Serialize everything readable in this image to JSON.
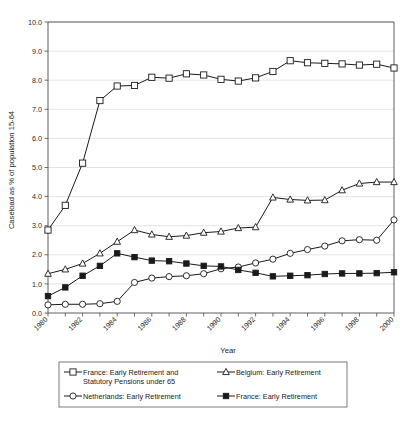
{
  "chart_data": {
    "type": "line",
    "title": "",
    "xlabel": "Year",
    "ylabel": "Caseload as % of population 15-64",
    "xlim": [
      1980,
      2000
    ],
    "ylim": [
      0.0,
      10.0
    ],
    "grid": true,
    "legend_position": "bottom",
    "x": [
      1980,
      1981,
      1982,
      1983,
      1984,
      1985,
      1986,
      1987,
      1988,
      1989,
      1990,
      1991,
      1992,
      1993,
      1994,
      1995,
      1996,
      1997,
      1998,
      1999,
      2000
    ],
    "y_ticks": [
      "0.0",
      "1.0",
      "2.0",
      "3.0",
      "4.0",
      "5.0",
      "6.0",
      "7.0",
      "8.0",
      "9.0",
      "10.0"
    ],
    "x_ticks": [
      "1980",
      "1982",
      "1984",
      "1986",
      "1988",
      "1990",
      "1992",
      "1994",
      "1996",
      "1998",
      "2000"
    ],
    "series": [
      {
        "name": "France: Early Retirement and Statutory Pensions under 65",
        "marker": "open-square",
        "values": [
          2.85,
          3.7,
          5.15,
          7.3,
          7.8,
          7.82,
          8.1,
          8.07,
          8.22,
          8.18,
          8.03,
          7.97,
          8.08,
          8.3,
          8.67,
          8.6,
          8.58,
          8.56,
          8.52,
          8.55,
          8.42
        ]
      },
      {
        "name": "Belgium: Early Retirement",
        "marker": "open-triangle",
        "values": [
          1.35,
          1.5,
          1.7,
          2.05,
          2.45,
          2.85,
          2.7,
          2.62,
          2.66,
          2.76,
          2.8,
          2.92,
          2.95,
          3.97,
          3.9,
          3.87,
          3.88,
          4.22,
          4.45,
          4.5,
          4.5
        ]
      },
      {
        "name": "Netherlands: Early Retirement",
        "marker": "open-circle",
        "values": [
          0.28,
          0.3,
          0.3,
          0.32,
          0.4,
          1.05,
          1.2,
          1.25,
          1.28,
          1.35,
          1.52,
          1.58,
          1.72,
          1.85,
          2.05,
          2.18,
          2.3,
          2.48,
          2.52,
          2.5,
          3.2
        ]
      },
      {
        "name": "France: Early Retirement",
        "marker": "filled-square",
        "values": [
          0.58,
          0.88,
          1.28,
          1.62,
          2.05,
          1.92,
          1.8,
          1.78,
          1.7,
          1.62,
          1.6,
          1.48,
          1.38,
          1.26,
          1.28,
          1.3,
          1.34,
          1.36,
          1.36,
          1.37,
          1.4
        ]
      }
    ],
    "legend": [
      {
        "label": "France: Early Retirement and Statutory Pensions under 65",
        "marker": "open-square"
      },
      {
        "label": "Belgium: Early Retirement",
        "marker": "open-triangle"
      },
      {
        "label": "Netherlands: Early Retirement",
        "marker": "open-circle"
      },
      {
        "label": "France: Early Retirement",
        "marker": "filled-square"
      }
    ],
    "legend_lines": {
      "entry1_line1": "France: Early Retirement and",
      "entry1_line2": "Statutory Pensions under 65",
      "entry2": "Belgium: Early Retirement",
      "entry3": "Netherlands: Early Retirement",
      "entry4": "France: Early Retirement"
    },
    "colors": {
      "line": "#1a1a1a",
      "grid": "#d9d9d9",
      "axis": "#4d4d4d",
      "background": "#ffffff"
    }
  }
}
